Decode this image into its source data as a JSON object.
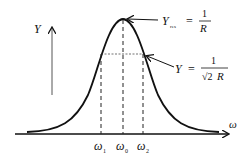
{
  "diagram": {
    "title": "",
    "type": "resonance-admittance-curve",
    "axes": {
      "x_label": "ω",
      "y_label": "Y"
    },
    "ticks": [
      {
        "label": "ω",
        "sub": "1"
      },
      {
        "label": "ω",
        "sub": "0"
      },
      {
        "label": "ω",
        "sub": "2"
      }
    ],
    "annotations": {
      "peak": {
        "lhs": "Y",
        "lhs_sub": "res",
        "equals": "=",
        "numerator": "1",
        "denominator": "R"
      },
      "half_power": {
        "lhs": "Y",
        "equals": "=",
        "numerator": "1",
        "denominator_root": "√2",
        "denominator_var": "R"
      }
    },
    "colors": {
      "curve": "#111111",
      "axis": "#111111",
      "dashed": "#222222",
      "background": "#ffffff"
    }
  }
}
